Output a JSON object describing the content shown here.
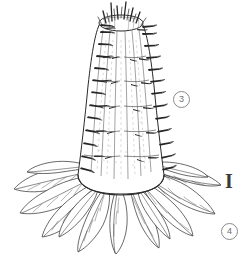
{
  "figure": {
    "background_color": "#ffffff",
    "ink_color": "#1a1a1a",
    "width": 243,
    "height": 254
  },
  "markers": {
    "circled_three": {
      "label": "3",
      "shape": "circled-number",
      "color": "#6e6e6e",
      "x": 173,
      "y": 91
    },
    "roman_one": {
      "label": "I",
      "shape": "roman-numeral",
      "color": "#3a3a3a",
      "x": 221,
      "y": 170
    },
    "circled_four": {
      "label": "4",
      "shape": "circled-number",
      "color": "#6e6e6e",
      "x": 221,
      "y": 223
    }
  },
  "illustration": {
    "style": "pen-and-ink line drawing",
    "subject": "columnar spiny stem on rosette of lanceolate leaves",
    "parts": {
      "crown": "flat elliptical apex with upright spines",
      "stem": "tapered conical ribbed trunk",
      "spines": "short tapered lateral spines in vertical rows",
      "leaves": "radiating lanceolate leaves with midrib and lateral veins"
    },
    "stem_ribs": 9,
    "spine_rows": 7,
    "leaf_count": 13
  }
}
